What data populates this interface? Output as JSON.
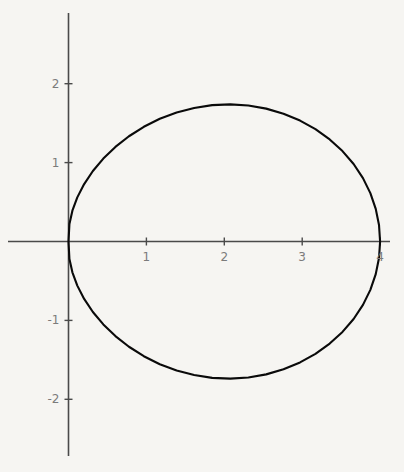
{
  "figure": {
    "background_color": "#f6f5f2",
    "curve_color": "#0a0a0a",
    "axis_color": "#4a4a4a",
    "label_color": "#7b7b7b"
  },
  "chart_data": {
    "type": "line",
    "title": "",
    "subtitle": "",
    "xlabel": "",
    "ylabel": "",
    "plot_kind": "polar-curve-cardioid",
    "equation": "r = 2(1 + cos(theta))",
    "grid": false,
    "legend": false,
    "legend_position": "none",
    "xlim": [
      -0.77,
      4.13
    ],
    "ylim": [
      -2.92,
      2.89
    ],
    "xticks": [
      1,
      2,
      3,
      4
    ],
    "yticks": [
      2,
      1,
      -1,
      -2
    ],
    "xtick_labels": [
      "1",
      "2",
      "3",
      "4"
    ],
    "ytick_labels": [
      "2",
      "1",
      "-1",
      "-2"
    ],
    "axis_origin": [
      0,
      0
    ],
    "key_points": {
      "cusp": [
        0,
        0
      ],
      "rightmost": [
        4,
        0
      ],
      "topmost": [
        1.5,
        2.598
      ],
      "bottommost": [
        1.5,
        -2.598
      ],
      "leftmost": [
        -0.5,
        1.732
      ],
      "y_axis_crossing_top": [
        0,
        2
      ],
      "y_axis_crossing_bottom": [
        0,
        -2
      ]
    },
    "x": [
      4,
      3.986,
      3.944,
      3.875,
      3.78,
      3.66,
      3.517,
      3.353,
      3.17,
      2.972,
      2.76,
      2.538,
      2.309,
      2.077,
      1.844,
      1.613,
      1.388,
      1.172,
      0.967,
      0.776,
      0.602,
      0.447,
      0.313,
      0.201,
      0.113,
      0.05,
      0.012,
      0,
      0.012,
      0.05,
      0.113,
      0.201,
      0.313,
      0.447,
      0.602,
      0.776,
      0.967,
      1.172,
      1.388,
      1.613,
      1.844,
      2.077,
      2.309,
      2.538,
      2.76,
      2.972,
      3.17,
      3.353,
      3.517,
      3.66,
      3.78,
      3.875,
      3.944,
      3.986,
      4
    ],
    "y": [
      0,
      0.209,
      0.414,
      0.613,
      0.803,
      0.982,
      1.146,
      1.294,
      1.424,
      1.533,
      1.62,
      1.684,
      1.723,
      1.738,
      1.728,
      1.693,
      1.635,
      1.555,
      1.454,
      1.334,
      1.199,
      1.051,
      0.893,
      0.728,
      0.559,
      0.39,
      0.223,
      0,
      -0.223,
      -0.39,
      -0.559,
      -0.728,
      -0.893,
      -1.051,
      -1.199,
      -1.334,
      -1.454,
      -1.555,
      -1.635,
      -1.693,
      -1.728,
      -1.738,
      -1.723,
      -1.684,
      -1.62,
      -1.533,
      -1.424,
      -1.294,
      -1.146,
      -0.982,
      -0.803,
      -0.613,
      -0.414,
      -0.209,
      0
    ]
  },
  "axes": {
    "x_axis_name": "horizontal-axis",
    "y_axis_name": "vertical-axis"
  }
}
